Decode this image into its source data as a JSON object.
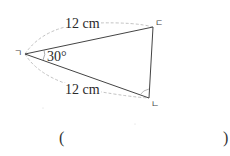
{
  "figure": {
    "type": "isosceles-triangle",
    "vertices": {
      "left": {
        "label": "ㄱ",
        "x": 25,
        "y": 54
      },
      "top_right": {
        "label": "ㄷ",
        "x": 153,
        "y": 27
      },
      "bottom_right": {
        "label": "ㄴ",
        "x": 149,
        "y": 98
      }
    },
    "side_top": {
      "label": "12 cm"
    },
    "side_bottom": {
      "label": "12 cm"
    },
    "angle_left": {
      "label": "30°"
    },
    "colors": {
      "stroke": "#444444",
      "dashed": "#bbbbbb"
    }
  },
  "answer": {
    "open_paren": "(",
    "close_paren": ")",
    "value": ""
  }
}
